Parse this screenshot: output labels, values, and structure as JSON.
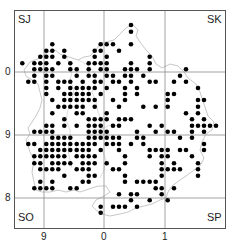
{
  "map": {
    "corner_labels": {
      "nw": "SJ",
      "ne": "SK",
      "sw": "SO",
      "se": "SP"
    },
    "x_ticks": [
      {
        "label": "9",
        "x": 44
      },
      {
        "label": "0",
        "x": 104
      },
      {
        "label": "1",
        "x": 165
      }
    ],
    "y_ticks": [
      {
        "label": "0",
        "y": 72
      },
      {
        "label": "9",
        "y": 135
      },
      {
        "label": "8",
        "y": 198
      }
    ],
    "colors": {
      "dot": "#000000",
      "grid": "#888888",
      "outline": "#c8c8c8",
      "frame": "#555555"
    },
    "grid_cell_px": 6.1,
    "dots_xy_3x": [
      [
        393,
        75
      ],
      [
        393,
        95
      ],
      [
        157,
        133
      ],
      [
        302,
        133
      ],
      [
        320,
        133
      ],
      [
        339,
        133
      ],
      [
        393,
        133
      ],
      [
        139,
        152
      ],
      [
        157,
        152
      ],
      [
        193,
        152
      ],
      [
        284,
        152
      ],
      [
        302,
        152
      ],
      [
        357,
        152
      ],
      [
        121,
        170
      ],
      [
        139,
        170
      ],
      [
        157,
        170
      ],
      [
        193,
        170
      ],
      [
        284,
        170
      ],
      [
        320,
        170
      ],
      [
        449,
        170
      ],
      [
        67,
        190
      ],
      [
        103,
        190
      ],
      [
        121,
        190
      ],
      [
        139,
        190
      ],
      [
        175,
        190
      ],
      [
        211,
        190
      ],
      [
        266,
        190
      ],
      [
        284,
        190
      ],
      [
        302,
        190
      ],
      [
        320,
        190
      ],
      [
        393,
        190
      ],
      [
        449,
        190
      ],
      [
        103,
        208
      ],
      [
        121,
        208
      ],
      [
        139,
        208
      ],
      [
        157,
        208
      ],
      [
        211,
        208
      ],
      [
        230,
        208
      ],
      [
        266,
        208
      ],
      [
        302,
        208
      ],
      [
        320,
        208
      ],
      [
        375,
        208
      ],
      [
        393,
        208
      ],
      [
        411,
        208
      ],
      [
        449,
        208
      ],
      [
        558,
        208
      ],
      [
        103,
        227
      ],
      [
        139,
        227
      ],
      [
        157,
        227
      ],
      [
        230,
        227
      ],
      [
        266,
        227
      ],
      [
        284,
        227
      ],
      [
        320,
        227
      ],
      [
        339,
        227
      ],
      [
        375,
        227
      ],
      [
        393,
        227
      ],
      [
        430,
        227
      ],
      [
        540,
        227
      ],
      [
        85,
        245
      ],
      [
        103,
        245
      ],
      [
        139,
        245
      ],
      [
        175,
        245
      ],
      [
        193,
        245
      ],
      [
        211,
        245
      ],
      [
        248,
        245
      ],
      [
        284,
        245
      ],
      [
        302,
        245
      ],
      [
        339,
        245
      ],
      [
        357,
        245
      ],
      [
        393,
        245
      ],
      [
        449,
        245
      ],
      [
        467,
        245
      ],
      [
        522,
        245
      ],
      [
        558,
        245
      ],
      [
        139,
        264
      ],
      [
        175,
        264
      ],
      [
        211,
        264
      ],
      [
        230,
        264
      ],
      [
        248,
        264
      ],
      [
        266,
        264
      ],
      [
        284,
        264
      ],
      [
        320,
        264
      ],
      [
        375,
        264
      ],
      [
        411,
        264
      ],
      [
        594,
        264
      ],
      [
        139,
        282
      ],
      [
        193,
        282
      ],
      [
        211,
        282
      ],
      [
        230,
        282
      ],
      [
        248,
        282
      ],
      [
        266,
        282
      ],
      [
        302,
        282
      ],
      [
        375,
        282
      ],
      [
        411,
        282
      ],
      [
        503,
        282
      ],
      [
        522,
        282
      ],
      [
        157,
        300
      ],
      [
        193,
        300
      ],
      [
        211,
        300
      ],
      [
        230,
        300
      ],
      [
        248,
        300
      ],
      [
        266,
        300
      ],
      [
        284,
        300
      ],
      [
        339,
        300
      ],
      [
        375,
        300
      ],
      [
        503,
        300
      ],
      [
        594,
        300
      ],
      [
        612,
        300
      ],
      [
        175,
        320
      ],
      [
        193,
        320
      ],
      [
        211,
        320
      ],
      [
        230,
        320
      ],
      [
        248,
        320
      ],
      [
        284,
        320
      ],
      [
        357,
        320
      ],
      [
        430,
        320
      ],
      [
        467,
        320
      ],
      [
        503,
        320
      ],
      [
        594,
        320
      ],
      [
        157,
        340
      ],
      [
        230,
        340
      ],
      [
        248,
        340
      ],
      [
        320,
        340
      ],
      [
        558,
        340
      ],
      [
        594,
        340
      ],
      [
        193,
        358
      ],
      [
        266,
        358
      ],
      [
        284,
        358
      ],
      [
        302,
        358
      ],
      [
        320,
        358
      ],
      [
        357,
        358
      ],
      [
        375,
        358
      ],
      [
        393,
        358
      ],
      [
        576,
        358
      ],
      [
        612,
        358
      ],
      [
        139,
        377
      ],
      [
        157,
        377
      ],
      [
        193,
        377
      ],
      [
        230,
        377
      ],
      [
        266,
        377
      ],
      [
        284,
        377
      ],
      [
        302,
        377
      ],
      [
        339,
        377
      ],
      [
        357,
        377
      ],
      [
        449,
        377
      ],
      [
        485,
        377
      ],
      [
        576,
        377
      ],
      [
        594,
        377
      ],
      [
        612,
        377
      ],
      [
        630,
        377
      ],
      [
        648,
        377
      ],
      [
        103,
        395
      ],
      [
        121,
        395
      ],
      [
        139,
        395
      ],
      [
        157,
        395
      ],
      [
        266,
        395
      ],
      [
        284,
        395
      ],
      [
        302,
        395
      ],
      [
        320,
        395
      ],
      [
        411,
        395
      ],
      [
        467,
        395
      ],
      [
        503,
        395
      ],
      [
        522,
        395
      ],
      [
        576,
        395
      ],
      [
        612,
        395
      ],
      [
        157,
        413
      ],
      [
        175,
        413
      ],
      [
        193,
        413
      ],
      [
        211,
        413
      ],
      [
        266,
        413
      ],
      [
        284,
        413
      ],
      [
        302,
        413
      ],
      [
        320,
        413
      ],
      [
        339,
        413
      ],
      [
        357,
        413
      ],
      [
        411,
        413
      ],
      [
        430,
        413
      ],
      [
        540,
        413
      ],
      [
        576,
        413
      ],
      [
        85,
        432
      ],
      [
        103,
        432
      ],
      [
        139,
        432
      ],
      [
        157,
        432
      ],
      [
        175,
        432
      ],
      [
        193,
        432
      ],
      [
        211,
        432
      ],
      [
        230,
        432
      ],
      [
        248,
        432
      ],
      [
        266,
        432
      ],
      [
        284,
        432
      ],
      [
        320,
        432
      ],
      [
        339,
        432
      ],
      [
        357,
        432
      ],
      [
        393,
        432
      ],
      [
        430,
        432
      ],
      [
        612,
        432
      ],
      [
        121,
        450
      ],
      [
        139,
        450
      ],
      [
        157,
        450
      ],
      [
        175,
        450
      ],
      [
        193,
        450
      ],
      [
        211,
        450
      ],
      [
        230,
        450
      ],
      [
        248,
        450
      ],
      [
        266,
        450
      ],
      [
        302,
        450
      ],
      [
        357,
        450
      ],
      [
        449,
        450
      ],
      [
        467,
        450
      ],
      [
        485,
        450
      ],
      [
        503,
        450
      ],
      [
        540,
        450
      ],
      [
        558,
        450
      ],
      [
        612,
        450
      ],
      [
        103,
        469
      ],
      [
        121,
        469
      ],
      [
        139,
        469
      ],
      [
        157,
        469
      ],
      [
        175,
        469
      ],
      [
        193,
        469
      ],
      [
        230,
        469
      ],
      [
        248,
        469
      ],
      [
        266,
        469
      ],
      [
        284,
        469
      ],
      [
        375,
        469
      ],
      [
        449,
        469
      ],
      [
        485,
        469
      ],
      [
        503,
        469
      ],
      [
        576,
        469
      ],
      [
        103,
        490
      ],
      [
        121,
        490
      ],
      [
        157,
        490
      ],
      [
        175,
        490
      ],
      [
        193,
        490
      ],
      [
        211,
        490
      ],
      [
        248,
        490
      ],
      [
        266,
        490
      ],
      [
        284,
        490
      ],
      [
        320,
        490
      ],
      [
        375,
        490
      ],
      [
        485,
        490
      ],
      [
        522,
        490
      ],
      [
        594,
        490
      ],
      [
        121,
        508
      ],
      [
        139,
        508
      ],
      [
        157,
        508
      ],
      [
        175,
        508
      ],
      [
        230,
        508
      ],
      [
        248,
        508
      ],
      [
        266,
        508
      ],
      [
        339,
        508
      ],
      [
        357,
        508
      ],
      [
        485,
        508
      ],
      [
        503,
        508
      ],
      [
        522,
        508
      ],
      [
        540,
        508
      ],
      [
        594,
        508
      ],
      [
        193,
        527
      ],
      [
        266,
        527
      ],
      [
        284,
        527
      ],
      [
        375,
        527
      ],
      [
        485,
        527
      ],
      [
        594,
        527
      ],
      [
        121,
        545
      ],
      [
        157,
        545
      ],
      [
        248,
        545
      ],
      [
        266,
        545
      ],
      [
        375,
        545
      ],
      [
        411,
        545
      ],
      [
        430,
        545
      ],
      [
        449,
        545
      ],
      [
        467,
        545
      ],
      [
        103,
        565
      ],
      [
        121,
        565
      ],
      [
        139,
        565
      ],
      [
        157,
        565
      ],
      [
        211,
        565
      ],
      [
        230,
        565
      ],
      [
        467,
        565
      ],
      [
        485,
        565
      ],
      [
        522,
        565
      ],
      [
        357,
        583
      ],
      [
        393,
        583
      ],
      [
        411,
        583
      ],
      [
        485,
        583
      ],
      [
        393,
        601
      ],
      [
        449,
        601
      ],
      [
        503,
        601
      ],
      [
        302,
        620
      ],
      [
        339,
        620
      ],
      [
        357,
        620
      ],
      [
        375,
        620
      ],
      [
        411,
        620
      ],
      [
        302,
        638
      ]
    ]
  }
}
